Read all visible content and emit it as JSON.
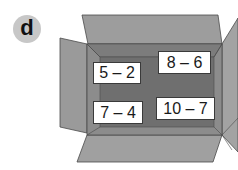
{
  "badge": {
    "label": "d"
  },
  "box": {
    "colors": {
      "flap": "#9a9a9a",
      "flap_light": "#a8a8a8",
      "inner": "#6e6e6e",
      "inner_edge": "#8a8a8a",
      "outline": "#4a4a4a"
    }
  },
  "cards": [
    {
      "expression": "5 – 2"
    },
    {
      "expression": "8 – 6"
    },
    {
      "expression": "7 – 4"
    },
    {
      "expression": "10 – 7"
    }
  ]
}
